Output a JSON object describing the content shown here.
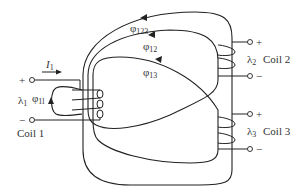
{
  "figure": {
    "type": "magnetically-coupled-coils",
    "colors": {
      "line": "#222222",
      "text": "#333333",
      "background": "#ffffff"
    }
  },
  "current": {
    "symbol": "I",
    "subscript": "1"
  },
  "coils": [
    {
      "name": "Coil 1",
      "flux_linkage": {
        "symbol": "λ",
        "subscript": "1"
      },
      "plus": "+",
      "minus": "−"
    },
    {
      "name": "Coil 2",
      "flux_linkage": {
        "symbol": "λ",
        "subscript": "2"
      },
      "plus": "+",
      "minus": "−"
    },
    {
      "name": "Coil 3",
      "flux_linkage": {
        "symbol": "λ",
        "subscript": "3"
      },
      "plus": "+",
      "minus": "−"
    }
  ],
  "fluxes": [
    {
      "symbol": "φ",
      "subscript": "123"
    },
    {
      "symbol": "φ",
      "subscript": "12"
    },
    {
      "symbol": "φ",
      "subscript": "13"
    },
    {
      "symbol": "φ",
      "subscript": "1l"
    }
  ]
}
